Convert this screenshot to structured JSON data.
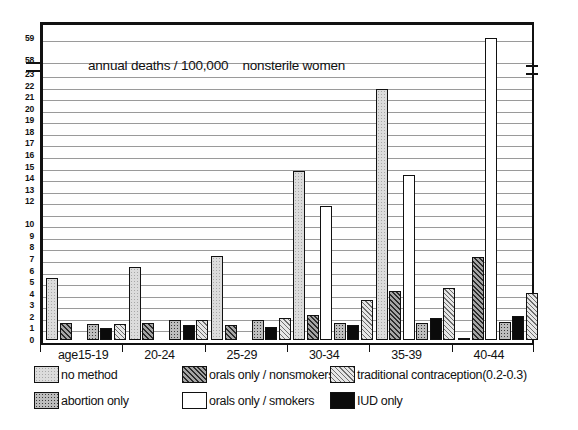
{
  "chart_data": {
    "type": "bar",
    "title": "annual deaths / 100,000    nonsterile women",
    "xlabel": "",
    "ylabel": "",
    "grid": true,
    "legend_position": "below",
    "axis_note": "y-axis has a break between 23 and 58",
    "x_prefix": "age",
    "categories": [
      "15-19",
      "20-24",
      "25-29",
      "30-34",
      "35-39",
      "40-44"
    ],
    "y_ticks": [
      "59",
      "58",
      "23",
      "22",
      "21",
      "20",
      "19",
      "18",
      "17",
      "16",
      "15",
      "14",
      "13",
      "12",
      "",
      "10",
      "9",
      "8",
      "7",
      "6",
      "5",
      "4",
      "3",
      "2",
      "1",
      "0"
    ],
    "ylim_lower": [
      0,
      23
    ],
    "ylim_upper": [
      58,
      59
    ],
    "series": [
      {
        "name": "no method",
        "key": "nomethod",
        "color": "#dcdcdc",
        "values": [
          5.4,
          6.3,
          7.3,
          14.6,
          21.7,
          23.2
        ]
      },
      {
        "name": "orals only / nonsmokers",
        "key": "orals-ns",
        "color": "#8f8f8f",
        "values": [
          1.5,
          1.5,
          1.3,
          2.2,
          4.2,
          7.2
        ]
      },
      {
        "name": "orals only / smokers",
        "key": "orals-sm",
        "color": "#ffffff",
        "values": [
          0,
          0,
          0,
          11.6,
          14.3,
          59.0
        ]
      },
      {
        "name": "abortion only",
        "key": "abortion",
        "color": "#bdbdbd",
        "values": [
          1.4,
          1.7,
          1.7,
          1.5,
          1.5,
          1.6
        ]
      },
      {
        "name": "IUD   only",
        "key": "iud",
        "color": "#0b0b0b",
        "values": [
          1.0,
          1.3,
          1.1,
          1.3,
          1.9,
          2.1
        ]
      },
      {
        "name": "traditional contraception (0.2 - 0.3)",
        "key": "traditional",
        "color": "#c9c9c9",
        "values": [
          1.4,
          1.7,
          1.9,
          3.5,
          4.5,
          4.1
        ]
      }
    ]
  },
  "legend": {
    "items": [
      {
        "label": "no method",
        "key": "nomethod"
      },
      {
        "label": "orals only / nonsmokers",
        "key": "orals-ns"
      },
      {
        "label": "traditional contraception(0.2-0.3)",
        "key": "traditional"
      },
      {
        "label": "abortion only",
        "key": "abortion"
      },
      {
        "label": "orals only / smokers",
        "key": "orals-sm"
      },
      {
        "label": "IUD   only",
        "key": "iud"
      }
    ]
  }
}
